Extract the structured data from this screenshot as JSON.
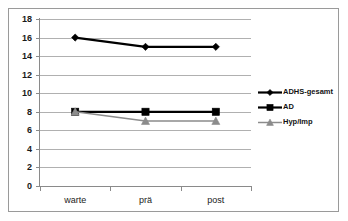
{
  "chart_data": {
    "type": "line",
    "title": "",
    "xlabel": "",
    "ylabel": "",
    "categories": [
      "warte",
      "prä",
      "post"
    ],
    "ylim": [
      0,
      18
    ],
    "ytick_step": 2,
    "yticks": [
      "0",
      "2",
      "4",
      "6",
      "8",
      "10",
      "12",
      "14",
      "16",
      "18"
    ],
    "grid": true,
    "legend_position": "right",
    "series": [
      {
        "name": "ADHS-gesamt",
        "values": [
          16,
          15,
          15
        ],
        "marker": "diamond",
        "color": "#000000"
      },
      {
        "name": "AD",
        "values": [
          8,
          8,
          8
        ],
        "marker": "square",
        "color": "#000000"
      },
      {
        "name": "Hyp/Imp",
        "values": [
          8,
          7,
          7
        ],
        "marker": "triangle",
        "color": "#8c8c8c"
      }
    ]
  },
  "legend": {
    "items": [
      {
        "label": "ADHS-gesamt",
        "marker": "diamond-marker-icon"
      },
      {
        "label": "AD",
        "marker": "square-marker-icon"
      },
      {
        "label": "Hyp/Imp",
        "marker": "triangle-marker-icon"
      }
    ]
  },
  "colors": {
    "frame": "#9a9a9a",
    "grid": "#b0b0b0",
    "axis": "#8a8a8a",
    "series_dark": "#000000",
    "series_gray": "#8c8c8c",
    "background": "#ffffff"
  }
}
